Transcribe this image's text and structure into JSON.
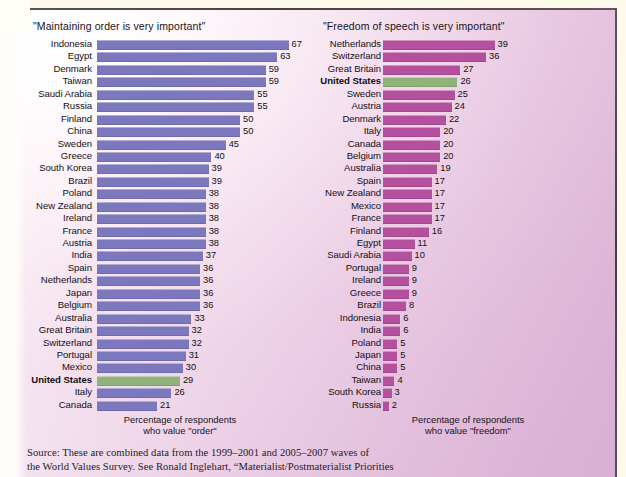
{
  "figure": {
    "background_left_color": "#fdfbfb",
    "background_right_color": "#d8aed5",
    "border_color": "#3b3036",
    "paper_margin_color": "#fdfaec"
  },
  "charts": {
    "order": {
      "title": "\"Maintaining order is very important\"",
      "axis_caption_line1": "Percentage of respondents",
      "axis_caption_line2": "who value \"order\"",
      "bar_color": "#7b78bd",
      "highlight_bar_color": "#8fb37a",
      "highlight_country": "United States",
      "rows": [
        {
          "country": "Indonesia",
          "value": 67
        },
        {
          "country": "Egypt",
          "value": 63
        },
        {
          "country": "Denmark",
          "value": 59
        },
        {
          "country": "Taiwan",
          "value": 59
        },
        {
          "country": "Saudi Arabia",
          "value": 55
        },
        {
          "country": "Russia",
          "value": 55
        },
        {
          "country": "Finland",
          "value": 50
        },
        {
          "country": "China",
          "value": 50
        },
        {
          "country": "Sweden",
          "value": 45
        },
        {
          "country": "Greece",
          "value": 40
        },
        {
          "country": "South Korea",
          "value": 39
        },
        {
          "country": "Brazil",
          "value": 39
        },
        {
          "country": "Poland",
          "value": 38
        },
        {
          "country": "New Zealand",
          "value": 38
        },
        {
          "country": "Ireland",
          "value": 38
        },
        {
          "country": "France",
          "value": 38
        },
        {
          "country": "Austria",
          "value": 38
        },
        {
          "country": "India",
          "value": 37
        },
        {
          "country": "Spain",
          "value": 36
        },
        {
          "country": "Netherlands",
          "value": 36
        },
        {
          "country": "Japan",
          "value": 36
        },
        {
          "country": "Belgium",
          "value": 36
        },
        {
          "country": "Australia",
          "value": 33
        },
        {
          "country": "Great Britain",
          "value": 32
        },
        {
          "country": "Switzerland",
          "value": 32
        },
        {
          "country": "Portugal",
          "value": 31
        },
        {
          "country": "Mexico",
          "value": 30
        },
        {
          "country": "United States",
          "value": 29,
          "highlight": true
        },
        {
          "country": "Italy",
          "value": 26
        },
        {
          "country": "Canada",
          "value": 21
        }
      ]
    },
    "freedom": {
      "title": "\"Freedom of speech is very important\"",
      "axis_caption_line1": "Percentage of respondents",
      "axis_caption_line2": "who value \"freedom\"",
      "bar_color": "#b5509e",
      "highlight_bar_color": "#8fb37a",
      "highlight_country": "United States",
      "rows": [
        {
          "country": "Netherlands",
          "value": 39
        },
        {
          "country": "Switzerland",
          "value": 36
        },
        {
          "country": "Great Britain",
          "value": 27
        },
        {
          "country": "United States",
          "value": 26,
          "highlight": true
        },
        {
          "country": "Sweden",
          "value": 25
        },
        {
          "country": "Austria",
          "value": 24
        },
        {
          "country": "Denmark",
          "value": 22
        },
        {
          "country": "Italy",
          "value": 20
        },
        {
          "country": "Canada",
          "value": 20
        },
        {
          "country": "Belgium",
          "value": 20
        },
        {
          "country": "Australia",
          "value": 19
        },
        {
          "country": "Spain",
          "value": 17
        },
        {
          "country": "New Zealand",
          "value": 17
        },
        {
          "country": "Mexico",
          "value": 17
        },
        {
          "country": "France",
          "value": 17
        },
        {
          "country": "Finland",
          "value": 16
        },
        {
          "country": "Egypt",
          "value": 11
        },
        {
          "country": "Saudi Arabia",
          "value": 10
        },
        {
          "country": "Portugal",
          "value": 9
        },
        {
          "country": "Ireland",
          "value": 9
        },
        {
          "country": "Greece",
          "value": 9
        },
        {
          "country": "Brazil",
          "value": 8
        },
        {
          "country": "Indonesia",
          "value": 6
        },
        {
          "country": "India",
          "value": 6
        },
        {
          "country": "Poland",
          "value": 5
        },
        {
          "country": "Japan",
          "value": 5
        },
        {
          "country": "China",
          "value": 5
        },
        {
          "country": "Taiwan",
          "value": 4
        },
        {
          "country": "South Korea",
          "value": 3
        },
        {
          "country": "Russia",
          "value": 2
        }
      ]
    }
  },
  "source_note": {
    "line1": "Source: These are combined data from the 1999–2001 and 2005–2007 waves of",
    "line2": "the World Values Survey. See Ronald Inglehart, “Materialist/Postmaterialist Priorities"
  },
  "chart_data": [
    {
      "type": "bar",
      "orientation": "horizontal",
      "title": "\"Maintaining order is very important\"",
      "xlabel": "Percentage of respondents who value \"order\"",
      "ylabel": "",
      "xlim": [
        0,
        70
      ],
      "grid": false,
      "legend": "none",
      "sorted": "descending",
      "value_labels": true,
      "bar_color": "#7b78bd",
      "highlight": {
        "category": "United States",
        "color": "#8fb37a",
        "bold_label": true
      },
      "categories": [
        "Indonesia",
        "Egypt",
        "Denmark",
        "Taiwan",
        "Saudi Arabia",
        "Russia",
        "Finland",
        "China",
        "Sweden",
        "Greece",
        "South Korea",
        "Brazil",
        "Poland",
        "New Zealand",
        "Ireland",
        "France",
        "Austria",
        "India",
        "Spain",
        "Netherlands",
        "Japan",
        "Belgium",
        "Australia",
        "Great Britain",
        "Switzerland",
        "Portugal",
        "Mexico",
        "United States",
        "Italy",
        "Canada"
      ],
      "values": [
        67,
        63,
        59,
        59,
        55,
        55,
        50,
        50,
        45,
        40,
        39,
        39,
        38,
        38,
        38,
        38,
        38,
        37,
        36,
        36,
        36,
        36,
        33,
        32,
        32,
        31,
        30,
        29,
        26,
        21
      ]
    },
    {
      "type": "bar",
      "orientation": "horizontal",
      "title": "\"Freedom of speech is very important\"",
      "xlabel": "Percentage of respondents who value \"freedom\"",
      "ylabel": "",
      "xlim": [
        0,
        70
      ],
      "grid": false,
      "legend": "none",
      "sorted": "descending",
      "value_labels": true,
      "bar_color": "#b5509e",
      "highlight": {
        "category": "United States",
        "color": "#8fb37a",
        "bold_label": true
      },
      "categories": [
        "Netherlands",
        "Switzerland",
        "Great Britain",
        "United States",
        "Sweden",
        "Austria",
        "Denmark",
        "Italy",
        "Canada",
        "Belgium",
        "Australia",
        "Spain",
        "New Zealand",
        "Mexico",
        "France",
        "Finland",
        "Egypt",
        "Saudi Arabia",
        "Portugal",
        "Ireland",
        "Greece",
        "Brazil",
        "Indonesia",
        "India",
        "Poland",
        "Japan",
        "China",
        "Taiwan",
        "South Korea",
        "Russia"
      ],
      "values": [
        39,
        36,
        27,
        26,
        25,
        24,
        22,
        20,
        20,
        20,
        19,
        17,
        17,
        17,
        17,
        16,
        11,
        10,
        9,
        9,
        9,
        8,
        6,
        6,
        5,
        5,
        5,
        4,
        3,
        2
      ]
    }
  ]
}
